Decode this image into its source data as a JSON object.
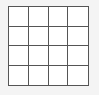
{
  "canvas": {
    "width": 99,
    "height": 95,
    "background_color": "#f4f4f4"
  },
  "grid": {
    "name": "empty-4x4-grid",
    "rows": 4,
    "columns": 4,
    "cell_count": 16,
    "line_color": "#555555",
    "cell_fill_color": "#ffffff",
    "border_width_px": 1,
    "cells": [
      [
        "",
        "",
        "",
        ""
      ],
      [
        "",
        "",
        "",
        ""
      ],
      [
        "",
        "",
        "",
        ""
      ],
      [
        "",
        "",
        "",
        ""
      ]
    ]
  }
}
